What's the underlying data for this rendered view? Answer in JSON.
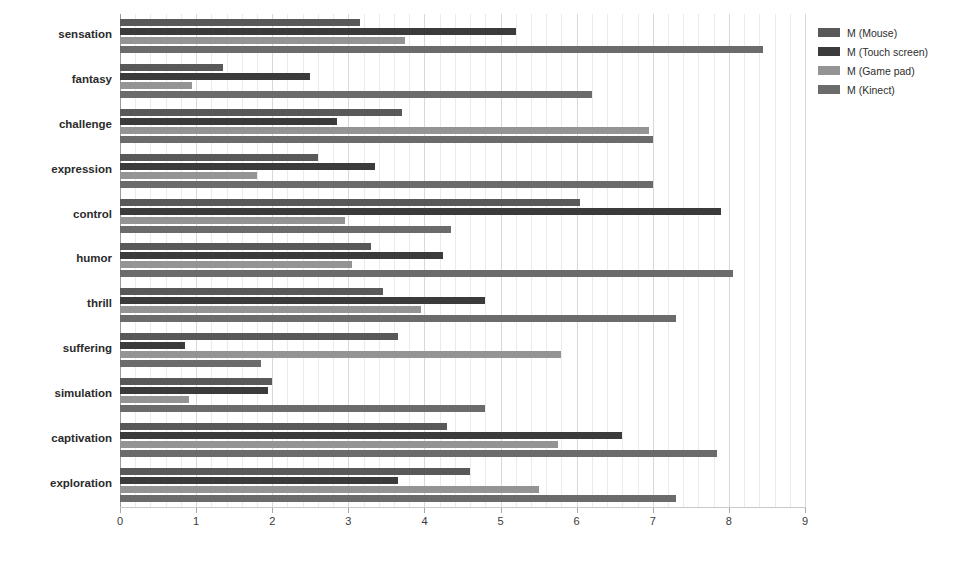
{
  "chart_data": {
    "type": "bar",
    "orientation": "horizontal",
    "title": "",
    "subtitle": "",
    "xlabel": "",
    "ylabel": "",
    "xlim": [
      0,
      9
    ],
    "xticks": [
      0,
      1,
      2,
      3,
      4,
      5,
      6,
      7,
      8,
      9
    ],
    "xtick_labels": [
      "0",
      "1",
      "2",
      "3",
      "4",
      "5",
      "6",
      "7",
      "8",
      "9"
    ],
    "grid": true,
    "grid_axis": "x",
    "legend_position": "right",
    "categories": [
      "sensation",
      "fantasy",
      "challenge",
      "expression",
      "control",
      "humor",
      "thrill",
      "suffering",
      "simulation",
      "captivation",
      "exploration"
    ],
    "series": [
      {
        "name": "M (Mouse)",
        "color": "#595959",
        "values": [
          3.15,
          1.35,
          3.7,
          2.6,
          6.05,
          3.3,
          3.45,
          3.65,
          2.0,
          4.3,
          4.6
        ]
      },
      {
        "name": "M (Touch screen)",
        "color": "#3b3b3b",
        "values": [
          5.2,
          2.5,
          2.85,
          3.35,
          7.9,
          4.25,
          4.8,
          0.85,
          1.95,
          6.6,
          3.65
        ]
      },
      {
        "name": "M (Game pad)",
        "color": "#949494",
        "values": [
          3.75,
          0.95,
          6.95,
          1.8,
          2.95,
          3.05,
          3.95,
          5.8,
          0.9,
          5.75,
          5.5
        ]
      },
      {
        "name": "M (Kinect)",
        "color": "#6b6b6b",
        "values": [
          8.45,
          6.2,
          7.0,
          7.0,
          4.35,
          8.05,
          7.3,
          1.85,
          4.8,
          7.85,
          7.3
        ]
      }
    ]
  },
  "legend": {
    "items": [
      {
        "label": "M (Mouse)",
        "color": "#595959"
      },
      {
        "label": "M (Touch screen)",
        "color": "#3b3b3b"
      },
      {
        "label": "M (Game pad)",
        "color": "#949494"
      },
      {
        "label": "M (Kinect)",
        "color": "#6b6b6b"
      }
    ]
  },
  "colors": {
    "background": "#ffffff",
    "gridline": "#d8d8d8",
    "gridline_minor": "#ebebeb",
    "axis": "#9a9a9a",
    "text": "#2b2b2b"
  }
}
